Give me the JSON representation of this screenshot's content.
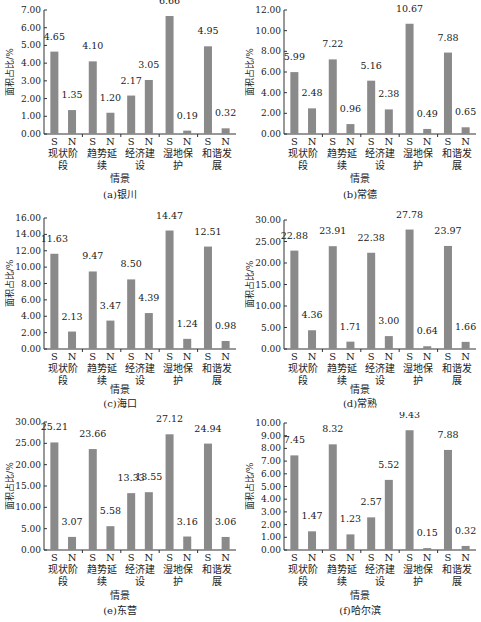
{
  "chart_data": [
    {
      "type": "bar",
      "title": "(a)银川",
      "xlabel": "情景",
      "ylabel": "面积占比/%",
      "categories": [
        "现状阶段",
        "趋势延续",
        "经济建设",
        "湿地保护",
        "和谐发展"
      ],
      "sub_labels": [
        "S",
        "N"
      ],
      "series": [
        {
          "name": "S",
          "values": [
            4.65,
            4.1,
            2.17,
            6.66,
            4.95
          ]
        },
        {
          "name": "N",
          "values": [
            1.35,
            1.2,
            3.05,
            0.19,
            0.32
          ]
        }
      ],
      "ylim": [
        0,
        7
      ],
      "yticks": [
        "0.00",
        "1.00",
        "2.00",
        "3.00",
        "4.00",
        "5.00",
        "6.00",
        "7.00"
      ],
      "grid": false
    },
    {
      "type": "bar",
      "title": "(b)常德",
      "xlabel": "情景",
      "ylabel": "面积占比/%",
      "categories": [
        "现状阶段",
        "趋势延续",
        "经济建设",
        "湿地保护",
        "和谐发展"
      ],
      "sub_labels": [
        "S",
        "N"
      ],
      "series": [
        {
          "name": "S",
          "values": [
            5.99,
            7.22,
            5.16,
            10.67,
            7.88
          ]
        },
        {
          "name": "N",
          "values": [
            2.48,
            0.96,
            2.38,
            0.49,
            0.65
          ]
        }
      ],
      "ylim": [
        0,
        12
      ],
      "yticks": [
        "0.00",
        "2.00",
        "4.00",
        "6.00",
        "8.00",
        "10.00",
        "12.00"
      ],
      "grid": false
    },
    {
      "type": "bar",
      "title": "(c)海口",
      "xlabel": "情景",
      "ylabel": "面积占比/%",
      "categories": [
        "现状阶段",
        "趋势延续",
        "经济建设",
        "湿地保护",
        "和谐发展"
      ],
      "sub_labels": [
        "S",
        "N"
      ],
      "series": [
        {
          "name": "S",
          "values": [
            11.63,
            9.47,
            8.5,
            14.47,
            12.51
          ]
        },
        {
          "name": "N",
          "values": [
            2.13,
            3.47,
            4.39,
            1.24,
            0.98
          ]
        }
      ],
      "ylim": [
        0,
        16
      ],
      "yticks": [
        "0.00",
        "2.00",
        "4.00",
        "6.00",
        "8.00",
        "10.00",
        "12.00",
        "14.00",
        "16.00"
      ],
      "grid": false
    },
    {
      "type": "bar",
      "title": "(d)常熟",
      "xlabel": "情景",
      "ylabel": "面积占比/%",
      "categories": [
        "现状阶段",
        "趋势延续",
        "经济建设",
        "湿地保护",
        "和谐发展"
      ],
      "sub_labels": [
        "S",
        "N"
      ],
      "series": [
        {
          "name": "S",
          "values": [
            22.88,
            23.91,
            22.38,
            27.78,
            23.97
          ]
        },
        {
          "name": "N",
          "values": [
            4.36,
            1.71,
            3.0,
            0.64,
            1.66
          ]
        }
      ],
      "ylim": [
        0,
        30
      ],
      "yticks": [
        "0.00",
        "5.00",
        "10.00",
        "15.00",
        "20.00",
        "25.00",
        "30.00"
      ],
      "grid": false
    },
    {
      "type": "bar",
      "title": "(e)东营",
      "xlabel": "情景",
      "ylabel": "面积占比/%",
      "categories": [
        "现状阶段",
        "趋势延续",
        "经济建设",
        "湿地保护",
        "和谐发展"
      ],
      "sub_labels": [
        "S",
        "N"
      ],
      "series": [
        {
          "name": "S",
          "values": [
            25.21,
            23.66,
            13.33,
            27.12,
            24.94
          ]
        },
        {
          "name": "N",
          "values": [
            3.07,
            5.58,
            13.55,
            3.16,
            3.06
          ]
        }
      ],
      "ylim": [
        0,
        30
      ],
      "yticks": [
        "0.00",
        "5.00",
        "10.00",
        "15.00",
        "20.00",
        "25.00",
        "30.00"
      ],
      "grid": false
    },
    {
      "type": "bar",
      "title": "(f)哈尔滨",
      "xlabel": "情景",
      "ylabel": "面积占比/%",
      "categories": [
        "现状阶段",
        "趋势延续",
        "经济建设",
        "湿地保护",
        "和谐发展"
      ],
      "sub_labels": [
        "S",
        "N"
      ],
      "series": [
        {
          "name": "S",
          "values": [
            7.45,
            8.32,
            2.57,
            9.43,
            7.88
          ]
        },
        {
          "name": "N",
          "values": [
            1.47,
            1.23,
            5.52,
            0.15,
            0.32
          ]
        }
      ],
      "ylim": [
        0,
        10
      ],
      "yticks": [
        "0.00",
        "1.00",
        "2.00",
        "3.00",
        "4.00",
        "5.00",
        "6.00",
        "7.00",
        "8.00",
        "9.00",
        "10.00"
      ],
      "grid": false
    }
  ],
  "colors": {
    "bar": "#8a8a8a",
    "axis": "#333333",
    "text": "#222222"
  },
  "panels": [
    {
      "caption": "(a)银川",
      "xtitle": "情景"
    },
    {
      "caption": "(b)常德",
      "xtitle": "情景"
    },
    {
      "caption": "(c)海口",
      "xtitle": "情景"
    },
    {
      "caption": "(d)常熟",
      "xtitle": "情景"
    },
    {
      "caption": "(e)东营",
      "xtitle": "情景"
    },
    {
      "caption": "(f)哈尔滨",
      "xtitle": "情景"
    }
  ]
}
